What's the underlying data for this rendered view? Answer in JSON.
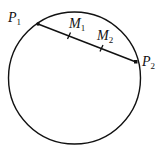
{
  "diagram": {
    "type": "circle-with-chord",
    "circle": {
      "cx": 74.5,
      "cy": 78,
      "r": 66
    },
    "chord": {
      "from": "P1",
      "to": "P2",
      "stroke": "#111111"
    },
    "points": [
      {
        "id": "P1",
        "label": "P",
        "subscript": "1",
        "x": 38,
        "y": 24,
        "label_x": 8,
        "label_y": 22
      },
      {
        "id": "P2",
        "label": "P",
        "subscript": "2",
        "x": 136,
        "y": 62,
        "label_x": 142,
        "label_y": 66
      }
    ],
    "midpoints": [
      {
        "id": "M1",
        "label": "M",
        "subscript": "1",
        "t": 0.333,
        "label_x": 69,
        "label_y": 28
      },
      {
        "id": "M2",
        "label": "M",
        "subscript": "2",
        "t": 0.667,
        "label_x": 97,
        "label_y": 40
      }
    ]
  }
}
